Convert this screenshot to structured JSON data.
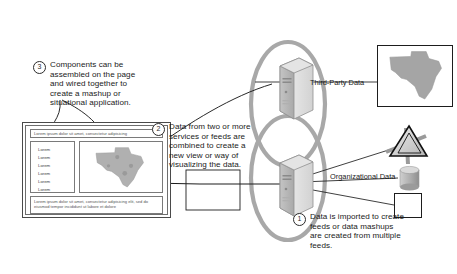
{
  "diagram": {
    "type": "flow-diagram",
    "background": "#ffffff",
    "accent": "#9a9a9a",
    "line_color": "#1d1d1d"
  },
  "callouts": [
    {
      "number": "1",
      "text": "Data is imported to create feeds or data mashups are created from multiple feeds.",
      "name": "callout-data-imported"
    },
    {
      "number": "2",
      "text": "Data from two or more services or feeds are combined to create a new view or way of visualizing the data.",
      "name": "callout-data-combined"
    },
    {
      "number": "3",
      "text": "Components can be assembled on the page and wired together to create a mashup or situational application.",
      "name": "callout-components-assembled"
    }
  ],
  "network": {
    "nodes": [
      {
        "label": "Third-Party Data",
        "icon": "server-tower-icon",
        "name": "node-third-party-data"
      },
      {
        "label": "Organizational Data",
        "icon": "server-tower-icon",
        "name": "node-organizational-data"
      }
    ],
    "cloud_shape": "overlapping-ellipses"
  },
  "data_sources": [
    {
      "icon": "map-texas-icon",
      "name": "source-map-visualization"
    },
    {
      "icon": "pyramid-icon",
      "name": "source-pyramid-data"
    },
    {
      "icon": "database-cylinder-icon",
      "name": "source-database"
    },
    {
      "icon": "bowtie-chart-icon",
      "name": "source-chart"
    }
  ],
  "mockup": {
    "header_text": "Lorem ipsum dolor sit amet, consectetur adipisicing",
    "list_items": [
      "Lorem",
      "Lorem",
      "Lorem",
      "Lorem",
      "Lorem",
      "Lorem"
    ],
    "map_widget": "map-texas-icon",
    "footer_text": "Lorem ipsum dolor sit amet, consectetur adipisicing elit, sed do eiusmod tempor incididunt ut labore et dolore"
  }
}
